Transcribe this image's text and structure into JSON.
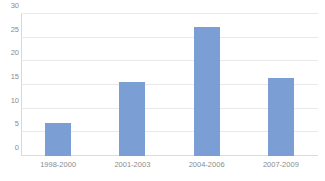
{
  "chart_data": {
    "type": "bar",
    "title": "",
    "title_note": "cropped-off at top edge",
    "categories": [
      "1998-2000",
      "2001-2003",
      "2004-2006",
      "2007-2009"
    ],
    "values": [
      7,
      15.7,
      27.3,
      16.4
    ],
    "xlabel": "",
    "ylabel": "",
    "ylim": [
      0,
      30
    ],
    "yticks": [
      0,
      5,
      10,
      15,
      20,
      25,
      30
    ],
    "ytick_labels": [
      "0",
      "5",
      "10",
      "15",
      "20",
      "25",
      "30"
    ],
    "grid": true,
    "grid_axis": "y",
    "legend": false,
    "bar_color": "#7b9fd4",
    "grid_color": "#e9e9e9",
    "text_color": "#8c8c8c"
  }
}
